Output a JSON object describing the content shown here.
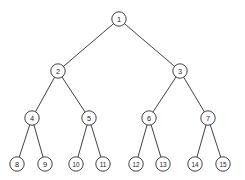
{
  "diagram": {
    "type": "binary-tree",
    "background_color": "#ffffff",
    "node_fill_color": "#ffffff",
    "node_stroke_color": "#2b2b2b",
    "edge_color": "#2b2b2b",
    "label_color": "#1a1a1a",
    "node_radius": 7.2,
    "levels": 4,
    "node_count": 15,
    "nodes": [
      {
        "id": 1,
        "label": "1",
        "x": 119,
        "y": 19,
        "level": 0,
        "parent": null
      },
      {
        "id": 2,
        "label": "2",
        "x": 58,
        "y": 71,
        "level": 1,
        "parent": 1
      },
      {
        "id": 3,
        "label": "3",
        "x": 180,
        "y": 71,
        "level": 1,
        "parent": 1
      },
      {
        "id": 4,
        "label": "4",
        "x": 32,
        "y": 118,
        "level": 2,
        "parent": 2
      },
      {
        "id": 5,
        "label": "5",
        "x": 89,
        "y": 118,
        "level": 2,
        "parent": 2
      },
      {
        "id": 6,
        "label": "6",
        "x": 149,
        "y": 118,
        "level": 2,
        "parent": 3
      },
      {
        "id": 7,
        "label": "7",
        "x": 208,
        "y": 118,
        "level": 2,
        "parent": 3
      },
      {
        "id": 8,
        "label": "8",
        "x": 17,
        "y": 164,
        "level": 3,
        "parent": 4
      },
      {
        "id": 9,
        "label": "9",
        "x": 45,
        "y": 164,
        "level": 3,
        "parent": 4
      },
      {
        "id": 10,
        "label": "10",
        "x": 76,
        "y": 164,
        "level": 3,
        "parent": 5
      },
      {
        "id": 11,
        "label": "11",
        "x": 103,
        "y": 164,
        "level": 3,
        "parent": 5
      },
      {
        "id": 12,
        "label": "12",
        "x": 136,
        "y": 164,
        "level": 3,
        "parent": 6
      },
      {
        "id": 13,
        "label": "13",
        "x": 163,
        "y": 164,
        "level": 3,
        "parent": 6
      },
      {
        "id": 14,
        "label": "14",
        "x": 195,
        "y": 164,
        "level": 3,
        "parent": 7
      },
      {
        "id": 15,
        "label": "15",
        "x": 223,
        "y": 164,
        "level": 3,
        "parent": 7
      }
    ],
    "edges": [
      {
        "from": 1,
        "to": 2
      },
      {
        "from": 1,
        "to": 3
      },
      {
        "from": 2,
        "to": 4
      },
      {
        "from": 2,
        "to": 5
      },
      {
        "from": 3,
        "to": 6
      },
      {
        "from": 3,
        "to": 7
      },
      {
        "from": 4,
        "to": 8
      },
      {
        "from": 4,
        "to": 9
      },
      {
        "from": 5,
        "to": 10
      },
      {
        "from": 5,
        "to": 11
      },
      {
        "from": 6,
        "to": 12
      },
      {
        "from": 6,
        "to": 13
      },
      {
        "from": 7,
        "to": 14
      },
      {
        "from": 7,
        "to": 15
      }
    ]
  }
}
